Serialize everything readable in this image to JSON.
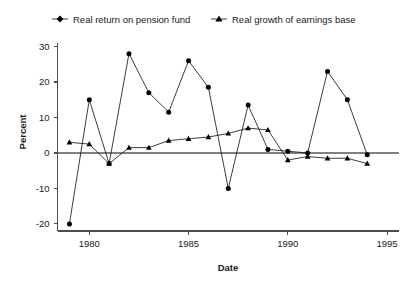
{
  "chart_data": {
    "type": "line",
    "title": "",
    "xlabel": "Date",
    "ylabel": "Percent",
    "xlim": [
      1978.4,
      1995.6
    ],
    "ylim": [
      -22,
      31
    ],
    "xticks": [
      1980,
      1985,
      1990,
      1995
    ],
    "yticks": [
      -20,
      -10,
      0,
      10,
      20,
      30
    ],
    "grid": false,
    "zero_line": true,
    "legend_position": "top",
    "legend": [
      "Real return on pension fund",
      "Real growth of earnings base"
    ],
    "x": [
      1979,
      1980,
      1981,
      1982,
      1983,
      1984,
      1985,
      1986,
      1987,
      1988,
      1989,
      1990,
      1991,
      1992,
      1993,
      1994
    ],
    "series": [
      {
        "name": "Real return on pension fund",
        "marker": "diamond",
        "values": [
          -20,
          15,
          -3,
          28,
          17,
          11.5,
          26,
          18.5,
          -10,
          13.5,
          1,
          0.5,
          0,
          23,
          15,
          -0.5
        ]
      },
      {
        "name": "Real growth of earnings base",
        "marker": "triangle",
        "values": [
          3,
          2.5,
          -3,
          1.5,
          1.5,
          3.5,
          4,
          4.5,
          5.5,
          7,
          6.5,
          -2,
          -1,
          -1.5,
          -1.5,
          -3
        ]
      }
    ]
  },
  "axes": {
    "y_label": "Percent",
    "x_label": "Date",
    "y_tick_labels": [
      "30",
      "20",
      "10",
      "0",
      "-10",
      "-20"
    ],
    "x_tick_labels": [
      "1980",
      "1985",
      "1990",
      "1995"
    ]
  },
  "legend": {
    "entry_1_label": "Real return on pension fund",
    "entry_2_label": "Real growth of earnings base"
  }
}
